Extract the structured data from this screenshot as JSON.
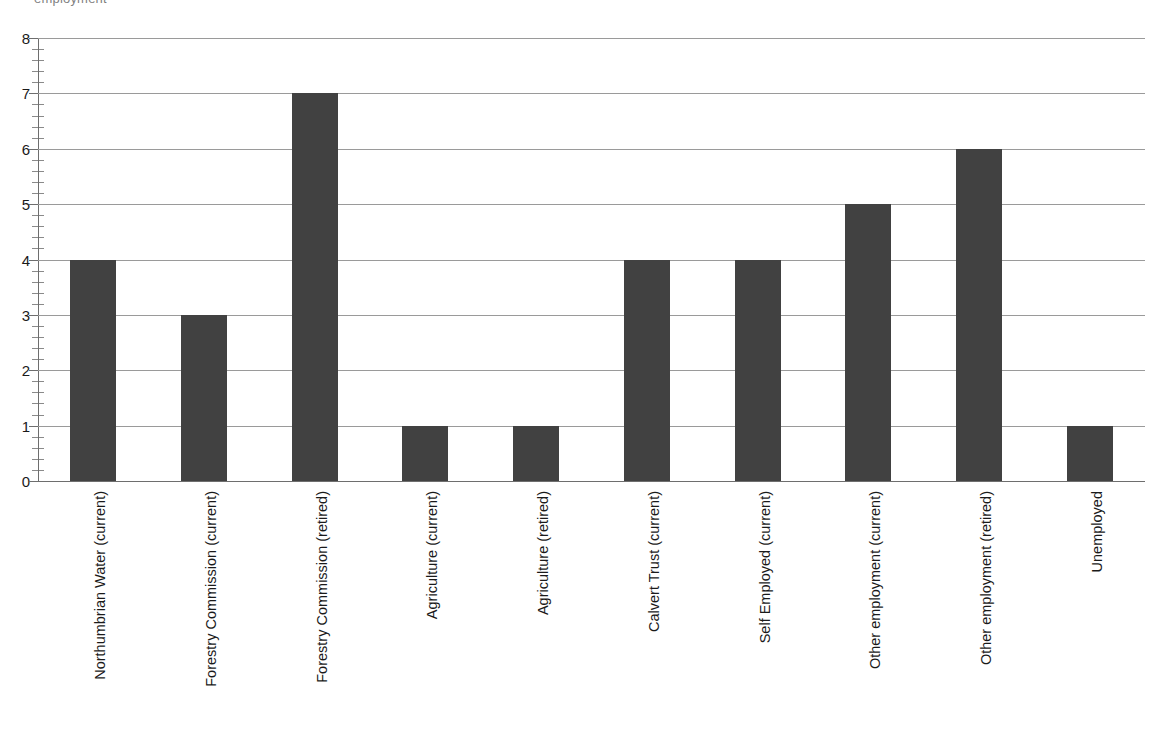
{
  "caption_fragment": "employment",
  "chart_data": {
    "type": "bar",
    "title": "",
    "subtitle": "",
    "xlabel": "",
    "ylabel": "",
    "ylim": [
      0,
      8
    ],
    "y_ticks": [
      0,
      1,
      2,
      3,
      4,
      5,
      6,
      7,
      8
    ],
    "y_minor_ticks_per_interval": 4,
    "grid": "horizontal",
    "legend": "none",
    "bar_color": "#414141",
    "gridline_color": "#9a9a9a",
    "axis_color": "#6e6e6e",
    "categories": [
      "Northumbrian Water (current)",
      "Forestry Commission (current)",
      "Forestry Commission (retired)",
      "Agriculture (current)",
      "Agriculture (retired)",
      "Calvert Trust (current)",
      "Self Employed (current)",
      "Other employment (current)",
      "Other employment (retired)",
      "Unemployed"
    ],
    "values": [
      4,
      3,
      7,
      1,
      1,
      4,
      4,
      5,
      6,
      1
    ]
  }
}
